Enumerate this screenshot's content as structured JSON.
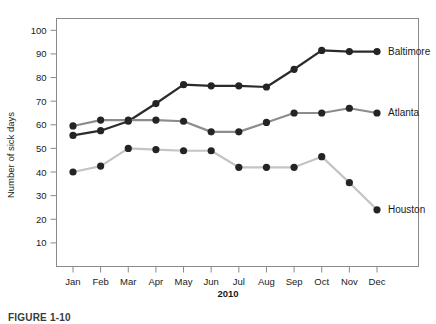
{
  "figure": {
    "caption": "FIGURE 1-10"
  },
  "chart_data": {
    "type": "line",
    "title": "",
    "xlabel": "2010",
    "ylabel": "Number of sick days",
    "categories": [
      "Jan",
      "Feb",
      "Mar",
      "Apr",
      "May",
      "Jun",
      "Jul",
      "Aug",
      "Sep",
      "Oct",
      "Nov",
      "Dec"
    ],
    "ylim": [
      0,
      105
    ],
    "yticks": [
      10,
      20,
      30,
      40,
      50,
      60,
      70,
      80,
      90,
      100
    ],
    "grid": false,
    "legend_position": "right-inline",
    "series": [
      {
        "name": "Baltimore",
        "color": "#2b2b2b",
        "values": [
          55.5,
          57.5,
          61.5,
          69,
          77,
          76.5,
          76.5,
          76,
          83.5,
          91.5,
          91,
          91
        ]
      },
      {
        "name": "Atlanta",
        "color": "#8c8c8c",
        "values": [
          59.5,
          62,
          62,
          62,
          61.5,
          57,
          57,
          61,
          65,
          65,
          67,
          65
        ]
      },
      {
        "name": "Houston",
        "color": "#c4c4c4",
        "values": [
          40,
          42.5,
          50,
          49.5,
          49,
          49,
          42,
          42,
          42,
          46.5,
          35.5,
          24
        ]
      }
    ]
  }
}
